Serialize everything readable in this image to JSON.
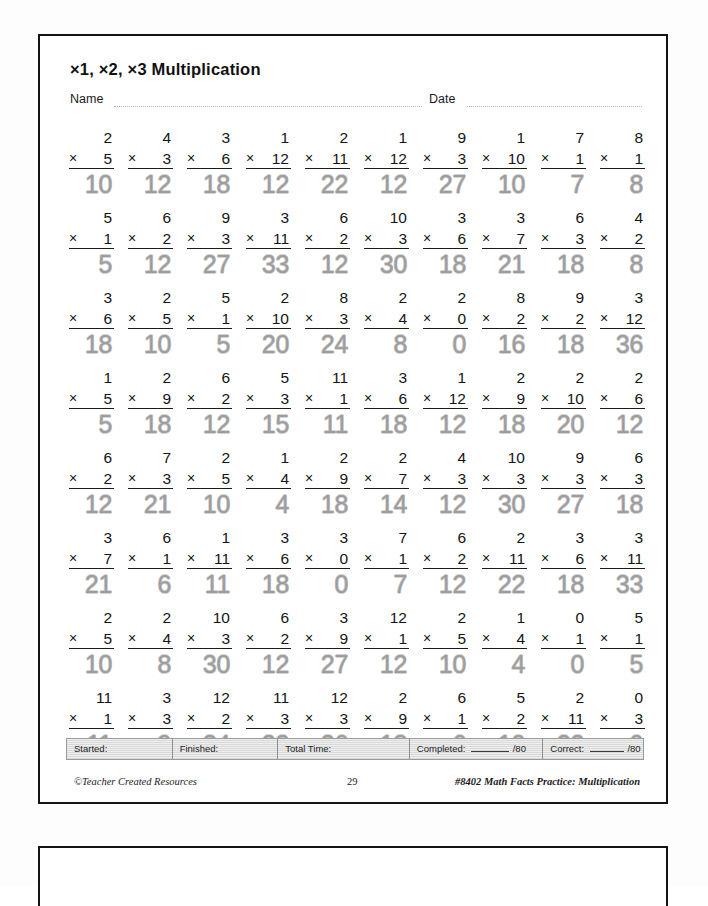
{
  "worksheet": {
    "title": "×1, ×2, ×3 Multiplication",
    "name_label": "Name",
    "date_label": "Date",
    "times_symbol": "×",
    "answer_color": "#9d9d9d",
    "rows": [
      [
        {
          "top": "2",
          "factor": "5",
          "answer": "10"
        },
        {
          "top": "4",
          "factor": "3",
          "answer": "12"
        },
        {
          "top": "3",
          "factor": "6",
          "answer": "18"
        },
        {
          "top": "1",
          "factor": "12",
          "answer": "12"
        },
        {
          "top": "2",
          "factor": "11",
          "answer": "22"
        },
        {
          "top": "1",
          "factor": "12",
          "answer": "12"
        },
        {
          "top": "9",
          "factor": "3",
          "answer": "27"
        },
        {
          "top": "1",
          "factor": "10",
          "answer": "10"
        },
        {
          "top": "7",
          "factor": "1",
          "answer": "7"
        },
        {
          "top": "8",
          "factor": "1",
          "answer": "8"
        }
      ],
      [
        {
          "top": "5",
          "factor": "1",
          "answer": "5"
        },
        {
          "top": "6",
          "factor": "2",
          "answer": "12"
        },
        {
          "top": "9",
          "factor": "3",
          "answer": "27"
        },
        {
          "top": "3",
          "factor": "11",
          "answer": "33"
        },
        {
          "top": "6",
          "factor": "2",
          "answer": "12"
        },
        {
          "top": "10",
          "factor": "3",
          "answer": "30"
        },
        {
          "top": "3",
          "factor": "6",
          "answer": "18"
        },
        {
          "top": "3",
          "factor": "7",
          "answer": "21"
        },
        {
          "top": "6",
          "factor": "3",
          "answer": "18"
        },
        {
          "top": "4",
          "factor": "2",
          "answer": "8"
        }
      ],
      [
        {
          "top": "3",
          "factor": "6",
          "answer": "18"
        },
        {
          "top": "2",
          "factor": "5",
          "answer": "10"
        },
        {
          "top": "5",
          "factor": "1",
          "answer": "5"
        },
        {
          "top": "2",
          "factor": "10",
          "answer": "20"
        },
        {
          "top": "8",
          "factor": "3",
          "answer": "24"
        },
        {
          "top": "2",
          "factor": "4",
          "answer": "8"
        },
        {
          "top": "2",
          "factor": "0",
          "answer": "0"
        },
        {
          "top": "8",
          "factor": "2",
          "answer": "16"
        },
        {
          "top": "9",
          "factor": "2",
          "answer": "18"
        },
        {
          "top": "3",
          "factor": "12",
          "answer": "36"
        }
      ],
      [
        {
          "top": "1",
          "factor": "5",
          "answer": "5"
        },
        {
          "top": "2",
          "factor": "9",
          "answer": "18"
        },
        {
          "top": "6",
          "factor": "2",
          "answer": "12"
        },
        {
          "top": "5",
          "factor": "3",
          "answer": "15"
        },
        {
          "top": "11",
          "factor": "1",
          "answer": "11"
        },
        {
          "top": "3",
          "factor": "6",
          "answer": "18"
        },
        {
          "top": "1",
          "factor": "12",
          "answer": "12"
        },
        {
          "top": "2",
          "factor": "9",
          "answer": "18"
        },
        {
          "top": "2",
          "factor": "10",
          "answer": "20"
        },
        {
          "top": "2",
          "factor": "6",
          "answer": "12"
        }
      ],
      [
        {
          "top": "6",
          "factor": "2",
          "answer": "12"
        },
        {
          "top": "7",
          "factor": "3",
          "answer": "21"
        },
        {
          "top": "2",
          "factor": "5",
          "answer": "10"
        },
        {
          "top": "1",
          "factor": "4",
          "answer": "4"
        },
        {
          "top": "2",
          "factor": "9",
          "answer": "18"
        },
        {
          "top": "2",
          "factor": "7",
          "answer": "14"
        },
        {
          "top": "4",
          "factor": "3",
          "answer": "12"
        },
        {
          "top": "10",
          "factor": "3",
          "answer": "30"
        },
        {
          "top": "9",
          "factor": "3",
          "answer": "27"
        },
        {
          "top": "6",
          "factor": "3",
          "answer": "18"
        }
      ],
      [
        {
          "top": "3",
          "factor": "7",
          "answer": "21"
        },
        {
          "top": "6",
          "factor": "1",
          "answer": "6"
        },
        {
          "top": "1",
          "factor": "11",
          "answer": "11"
        },
        {
          "top": "3",
          "factor": "6",
          "answer": "18"
        },
        {
          "top": "3",
          "factor": "0",
          "answer": "0"
        },
        {
          "top": "7",
          "factor": "1",
          "answer": "7"
        },
        {
          "top": "6",
          "factor": "2",
          "answer": "12"
        },
        {
          "top": "2",
          "factor": "11",
          "answer": "22"
        },
        {
          "top": "3",
          "factor": "6",
          "answer": "18"
        },
        {
          "top": "3",
          "factor": "11",
          "answer": "33"
        }
      ],
      [
        {
          "top": "2",
          "factor": "5",
          "answer": "10"
        },
        {
          "top": "2",
          "factor": "4",
          "answer": "8"
        },
        {
          "top": "10",
          "factor": "3",
          "answer": "30"
        },
        {
          "top": "6",
          "factor": "2",
          "answer": "12"
        },
        {
          "top": "3",
          "factor": "9",
          "answer": "27"
        },
        {
          "top": "12",
          "factor": "1",
          "answer": "12"
        },
        {
          "top": "2",
          "factor": "5",
          "answer": "10"
        },
        {
          "top": "1",
          "factor": "4",
          "answer": "4"
        },
        {
          "top": "0",
          "factor": "1",
          "answer": "0"
        },
        {
          "top": "5",
          "factor": "1",
          "answer": "5"
        }
      ],
      [
        {
          "top": "11",
          "factor": "1",
          "answer": "11"
        },
        {
          "top": "3",
          "factor": "3",
          "answer": "9"
        },
        {
          "top": "12",
          "factor": "2",
          "answer": "24"
        },
        {
          "top": "11",
          "factor": "3",
          "answer": "33"
        },
        {
          "top": "12",
          "factor": "3",
          "answer": "36"
        },
        {
          "top": "2",
          "factor": "9",
          "answer": "18"
        },
        {
          "top": "6",
          "factor": "1",
          "answer": "6"
        },
        {
          "top": "5",
          "factor": "2",
          "answer": "10"
        },
        {
          "top": "2",
          "factor": "11",
          "answer": "22"
        },
        {
          "top": "0",
          "factor": "3",
          "answer": "0"
        }
      ]
    ]
  },
  "timebar": {
    "started_label": "Started:",
    "finished_label": "Finished:",
    "total_time_label": "Total Time:",
    "completed_label": "Completed:",
    "completed_total": "/80",
    "correct_label": "Correct:",
    "correct_total": "/80"
  },
  "credits": {
    "publisher": "©Teacher Created Resources",
    "page_number": "29",
    "book": "#8402 Math Facts Practice: Multiplication"
  }
}
